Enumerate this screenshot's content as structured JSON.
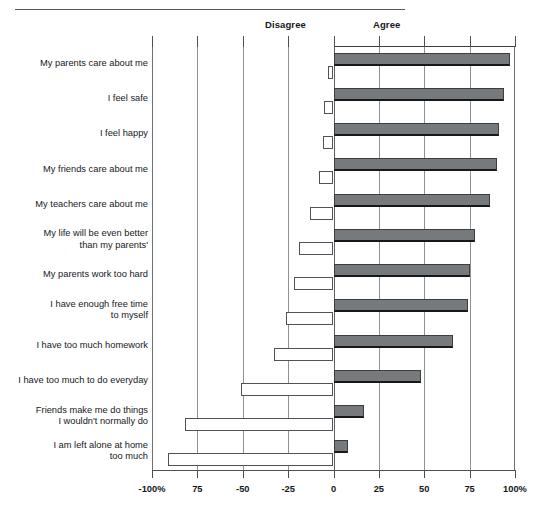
{
  "headers": {
    "disagree": "Disagree",
    "agree": "Agree"
  },
  "axis": {
    "tick_labels": [
      "-100%",
      "75",
      "-50",
      "-25",
      "0",
      "25",
      "50",
      "75",
      "100%"
    ],
    "tick_values": [
      -100,
      -75,
      -50,
      -25,
      0,
      25,
      50,
      75,
      100
    ]
  },
  "chart_data": {
    "type": "bar",
    "orientation": "horizontal",
    "title": "",
    "xlabel": "",
    "ylabel": "",
    "xlim": [
      -100,
      100
    ],
    "grid": true,
    "legend_position": "top",
    "categories": [
      "My parents care about me",
      "I feel safe",
      "I feel happy",
      "My friends care about me",
      "My teachers care about me",
      "My life will be even better\nthan my parents'",
      "My parents work too hard",
      "I have enough free time\nto myself",
      "I have too much homework",
      "I have too much to do everyday",
      "Friends make me do things\nI wouldn't normally do",
      "I am left alone at home\ntoo much"
    ],
    "series": [
      {
        "name": "Agree",
        "color": "#777a7c",
        "values": [
          97,
          94,
          91,
          90,
          86,
          78,
          75,
          74,
          66,
          48,
          17,
          8
        ]
      },
      {
        "name": "Disagree",
        "color": "#ffffff",
        "values": [
          -3,
          -5,
          -6,
          -8,
          -13,
          -19,
          -22,
          -26,
          -33,
          -51,
          -82,
          -91
        ]
      }
    ]
  }
}
